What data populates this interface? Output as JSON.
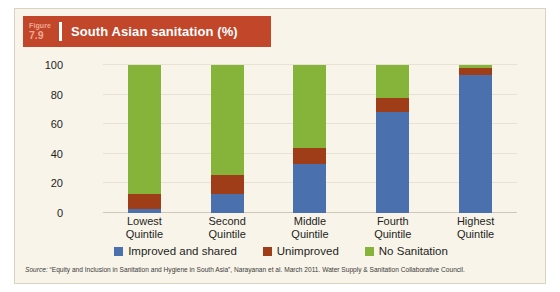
{
  "figure": {
    "label_word": "Figure",
    "number": "7.9",
    "title": "South Asian sanitation (%)",
    "banner_color": "#C1462A",
    "card_background": "#F8F4EA"
  },
  "source": {
    "prefix": "Source:",
    "text": "“Equity and Inclusion in Sanitation and Hygiene in South Asia”, Narayanan et al. March 2011. Water Supply & Sanitation Collaborative Council."
  },
  "chart_data": {
    "type": "bar",
    "title": "South Asian sanitation (%)",
    "stacked": true,
    "orientation": "vertical",
    "xlabel": "",
    "ylabel": "",
    "ylim": [
      0,
      100
    ],
    "yticks": [
      0,
      20,
      40,
      60,
      80,
      100
    ],
    "grid": true,
    "legend_position": "bottom",
    "categories": [
      "Lowest Quintile",
      "Second Quintile",
      "Middle Quintile",
      "Fourth Quintile",
      "Highest Quintile"
    ],
    "categories_lines": [
      [
        "Lowest",
        "Quintile"
      ],
      [
        "Second",
        "Quintile"
      ],
      [
        "Middle",
        "Quintile"
      ],
      [
        "Fourth",
        "Quintile"
      ],
      [
        "Highest",
        "Quintile"
      ]
    ],
    "series": [
      {
        "name": "Improved and shared",
        "color": "#4A70AD",
        "values": [
          3,
          13,
          33,
          68,
          93
        ]
      },
      {
        "name": "Unimproved",
        "color": "#9E3D18",
        "values": [
          10,
          13,
          11,
          10,
          5
        ]
      },
      {
        "name": "No Sanitation",
        "color": "#86B33A",
        "values": [
          87,
          74,
          56,
          22,
          2
        ]
      }
    ]
  }
}
